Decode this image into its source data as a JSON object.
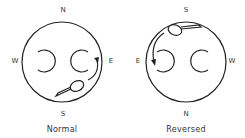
{
  "diagrams": [
    {
      "caption": "Normal",
      "compass": {
        "top": "N",
        "left": "W",
        "right": "E",
        "bottom": "S"
      }
    },
    {
      "caption": "Reversed",
      "compass": {
        "top": "S",
        "left": "E",
        "right": "W",
        "bottom": "N"
      }
    }
  ],
  "colors": {
    "stroke": "#222222",
    "background": "#ffffff"
  }
}
